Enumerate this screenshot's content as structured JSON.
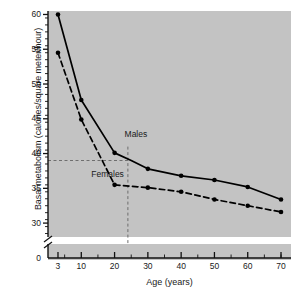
{
  "chart_data": {
    "type": "line",
    "title": "",
    "xlabel": "Age (years)",
    "ylabel": "Basal metabolism (calories/square meter/hour)",
    "xlim": [
      0,
      73
    ],
    "ylim": [
      28,
      60.5
    ],
    "y_axis_break": true,
    "y_axis_break_label": "0",
    "grid": false,
    "legend_position": "inline-annotation",
    "xticks": [
      "3",
      "10",
      "20",
      "30",
      "40",
      "50",
      "60",
      "70"
    ],
    "xtick_values": [
      3,
      10,
      20,
      30,
      40,
      50,
      60,
      70
    ],
    "yticks": [
      "30",
      "35",
      "40",
      "45",
      "50",
      "55",
      "60"
    ],
    "ytick_values": [
      30,
      35,
      40,
      45,
      50,
      55,
      60
    ],
    "minor_ticks": true,
    "series": [
      {
        "name": "Males",
        "style": "solid",
        "x": [
          3,
          10,
          20,
          25,
          30,
          40,
          50,
          60,
          70
        ],
        "values": [
          60.0,
          47.7,
          40.1,
          39.0,
          37.8,
          36.8,
          36.2,
          35.2,
          33.4
        ]
      },
      {
        "name": "Females",
        "style": "dashed",
        "x": [
          3,
          10,
          20,
          25,
          30,
          40,
          50,
          60,
          70
        ],
        "values": [
          54.5,
          44.9,
          35.5,
          35.3,
          35.1,
          34.5,
          33.4,
          32.5,
          31.6
        ]
      }
    ],
    "annotations": [
      {
        "text": "Males",
        "x": 23,
        "y": 42.6
      },
      {
        "text": "Females",
        "x": 13,
        "y": 36.9
      }
    ],
    "reference_lines": [
      {
        "orientation": "horizontal",
        "value": 39.0,
        "style": "dashed"
      },
      {
        "orientation": "vertical",
        "value": 24.0,
        "style": "dashed"
      }
    ],
    "colors": {
      "plot_background": "#c3c3c3",
      "page_background": "#ffffff",
      "line": "#000000",
      "reference_line": "#6e6e6e",
      "text": "#1a1a1a"
    }
  }
}
